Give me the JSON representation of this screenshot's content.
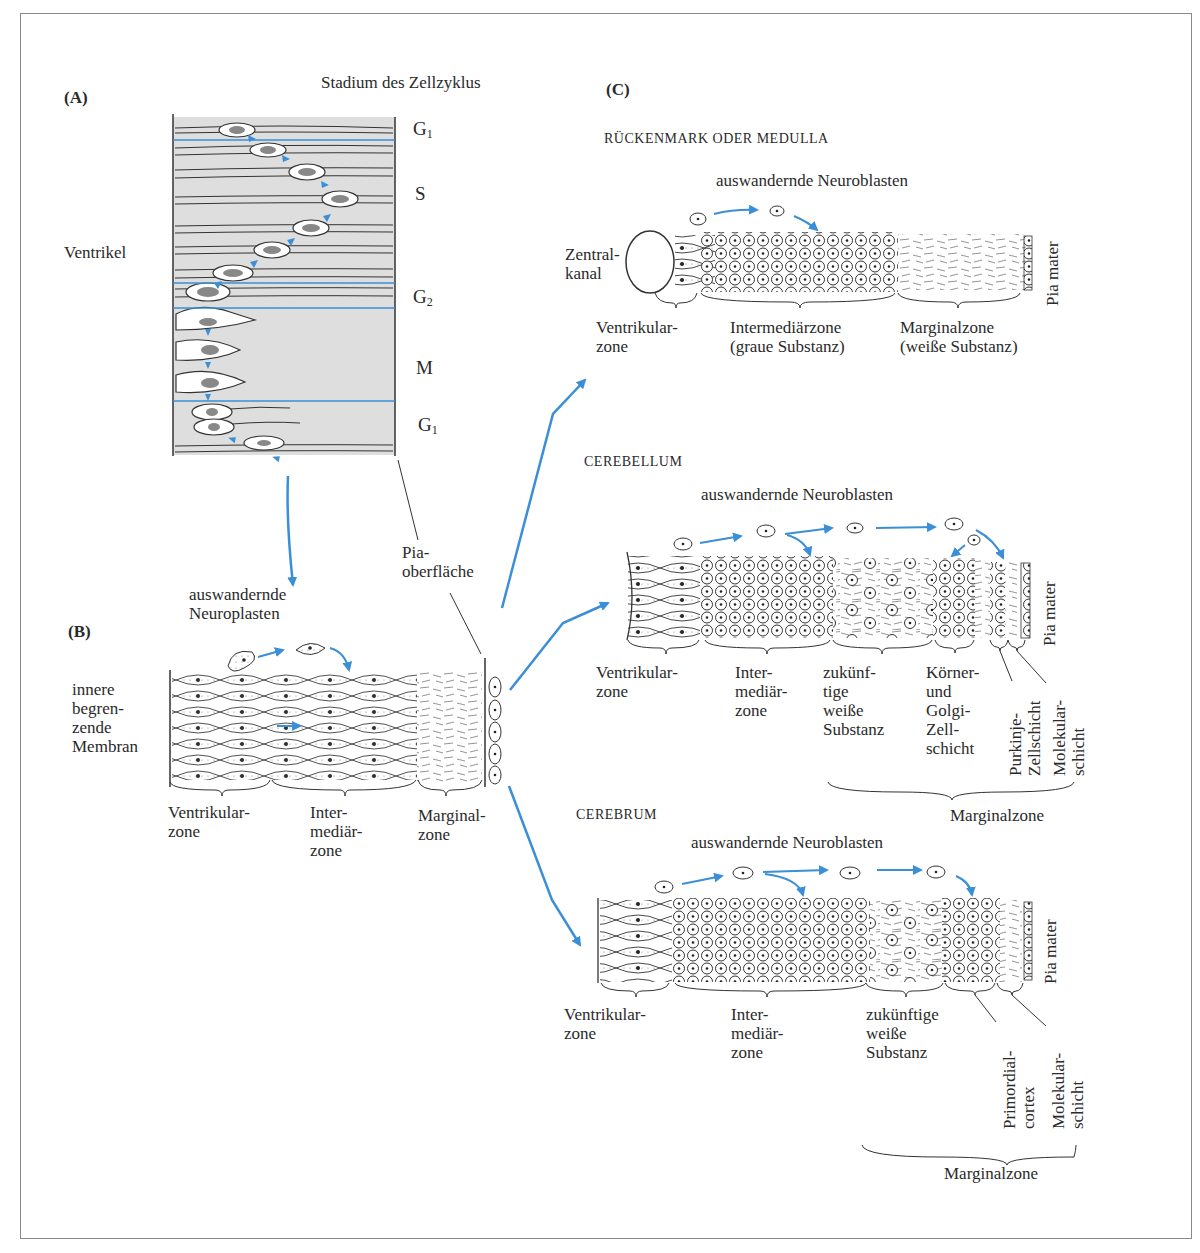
{
  "colors": {
    "accent_blue": "#3a8fd6",
    "panel_gray": "#dedede",
    "ink": "#2a2a2a",
    "frame": "#8a8a8a"
  },
  "panelA": {
    "label": "(A)",
    "title": "Stadium des Zellzyklus",
    "ventricle_label": "Ventrikel",
    "phases": [
      {
        "main": "G",
        "sub": "1"
      },
      {
        "main": "S",
        "sub": ""
      },
      {
        "main": "G",
        "sub": "2"
      },
      {
        "main": "M",
        "sub": ""
      },
      {
        "main": "G",
        "sub": "1"
      }
    ]
  },
  "panelB": {
    "label": "(B)",
    "migrating_label_line1": "auswandernde",
    "migrating_label_line2": "Neuroplasten",
    "pia_label_line1": "Pia-",
    "pia_label_line2": "oberfläche",
    "membrane_label": [
      "innere",
      "begren-",
      "zende",
      "Membran"
    ],
    "zones": [
      {
        "lines": [
          "Ventrikular-",
          "zone"
        ]
      },
      {
        "lines": [
          "Inter-",
          "mediär-",
          "zone"
        ]
      },
      {
        "lines": [
          "Marginal-",
          "zone"
        ]
      }
    ]
  },
  "panelC": {
    "label": "(C)",
    "spinal": {
      "title": "RÜCKENMARK ODER MEDULLA",
      "migrating_label": "auswandernde Neuroblasten",
      "canal_label": [
        "Zentral-",
        "kanal"
      ],
      "pia_label": "Pia mater",
      "zones": [
        {
          "lines": [
            "Ventrikular-",
            "zone"
          ]
        },
        {
          "lines": [
            "Intermediärzone",
            "(graue Substanz)"
          ]
        },
        {
          "lines": [
            "Marginalzone",
            "(weiße Substanz)"
          ]
        }
      ]
    },
    "cerebellum": {
      "title": "CEREBELLUM",
      "migrating_label": "auswandernde Neuroblasten",
      "pia_label": "Pia mater",
      "zones": [
        {
          "lines": [
            "Ventrikular-",
            "zone"
          ]
        },
        {
          "lines": [
            "Inter-",
            "mediär-",
            "zone"
          ]
        },
        {
          "lines": [
            "zukünf-",
            "tige",
            "weiße",
            "Substanz"
          ]
        },
        {
          "lines": [
            "Körner-",
            "und",
            "Golgi-",
            "Zell-",
            "schicht"
          ]
        }
      ],
      "vertical_labels": [
        {
          "lines": [
            "Purkinje-",
            "Zellschicht"
          ]
        },
        {
          "lines": [
            "Molekular-",
            "schicht"
          ]
        }
      ],
      "group_label": "Marginalzone"
    },
    "cerebrum": {
      "title": "CEREBRUM",
      "migrating_label": "auswandernde Neuroblasten",
      "pia_label": "Pia mater",
      "zones": [
        {
          "lines": [
            "Ventrikular-",
            "zone"
          ]
        },
        {
          "lines": [
            "Inter-",
            "mediär-",
            "zone"
          ]
        },
        {
          "lines": [
            "zukünftige",
            "weiße",
            "Substanz"
          ]
        }
      ],
      "vertical_labels": [
        {
          "lines": [
            "Primordial-",
            "cortex"
          ]
        },
        {
          "lines": [
            "Molekular-",
            "schicht"
          ]
        }
      ],
      "group_label": "Marginalzone"
    }
  }
}
